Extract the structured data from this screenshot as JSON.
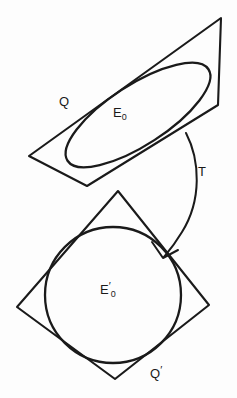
{
  "figure": {
    "background_color": "#fdfdfd",
    "ink_color": "#1a1a1a",
    "labels": {
      "upper_quad": {
        "text": "Q",
        "x": 59,
        "y": 93
      },
      "upper_conic": {
        "base": "E",
        "sub": "0",
        "x": 113,
        "y": 104
      },
      "map": {
        "text": "T",
        "x": 198,
        "y": 163
      },
      "lower_conic": {
        "base": "E",
        "prime": "′",
        "sub": "0",
        "x": 100,
        "y": 281
      },
      "lower_quad": {
        "base": "Q",
        "prime": "′",
        "x": 150,
        "y": 365
      }
    },
    "upper_figure": {
      "name": "upper-quadrilateral-with-ellipse",
      "quad_points": "221,18 218,105 87,186 29,156",
      "conic_type": "ellipse",
      "ellipse": {
        "cx": 138,
        "cy": 115,
        "rx": 84,
        "ry": 30,
        "rotation_deg": -33
      }
    },
    "lower_figure": {
      "name": "lower-quadrilateral-with-circle",
      "quad_points": "118,191 209,305 115,379 17,307",
      "conic_type": "circle",
      "circle": {
        "cx": 113,
        "cy": 295,
        "r": 68
      }
    },
    "arrow": {
      "name": "transformation-arrow",
      "path": "M 186 133 C 200 160, 202 200, 182 232 C 176 242, 170 250, 164 257",
      "head": "M 152 242 L 163 258 L 178 250",
      "direction": "from upper figure to lower figure"
    }
  }
}
